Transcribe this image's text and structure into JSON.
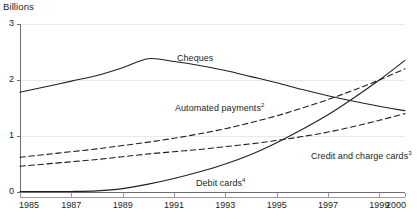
{
  "chart_data": {
    "type": "line",
    "title": "",
    "xlabel": "",
    "ylabel": "Billions",
    "ylim": [
      0,
      3
    ],
    "xlim": [
      1985,
      2000
    ],
    "grid": true,
    "legend_position": "inline-labels",
    "y_ticks": [
      "0",
      "1",
      "2",
      "3"
    ],
    "y_tick_values": [
      0,
      1,
      2,
      3
    ],
    "x_ticks": [
      "1985",
      "1987",
      "1989",
      "1991",
      "1993",
      "1995",
      "1997",
      "1999",
      "2000"
    ],
    "x_tick_values": [
      1985,
      1987,
      1989,
      1991,
      1993,
      1995,
      1997,
      1999,
      2000
    ],
    "x": [
      1985,
      1986,
      1987,
      1988,
      1989,
      1990,
      1991,
      1992,
      1993,
      1994,
      1995,
      1996,
      1997,
      1998,
      1999,
      2000
    ],
    "series": [
      {
        "name": "Cheques",
        "label": "Cheques",
        "footnote": "",
        "style": "solid",
        "color": "#231f20",
        "values": [
          1.78,
          1.88,
          1.98,
          2.08,
          2.22,
          2.38,
          2.33,
          2.26,
          2.17,
          2.06,
          1.95,
          1.83,
          1.72,
          1.62,
          1.53,
          1.45
        ]
      },
      {
        "name": "Automated payments",
        "label": "Automated payments",
        "footnote": "2",
        "style": "dashed",
        "color": "#231f20",
        "values": [
          0.62,
          0.67,
          0.72,
          0.77,
          0.83,
          0.89,
          0.96,
          1.04,
          1.13,
          1.24,
          1.36,
          1.5,
          1.65,
          1.82,
          2.0,
          2.2
        ]
      },
      {
        "name": "Credit and charge cards",
        "label": "Credit and charge cards",
        "footnote": "3",
        "style": "dashed",
        "color": "#231f20",
        "values": [
          0.46,
          0.5,
          0.54,
          0.58,
          0.63,
          0.68,
          0.72,
          0.76,
          0.81,
          0.86,
          0.92,
          0.99,
          1.07,
          1.17,
          1.28,
          1.4
        ]
      },
      {
        "name": "Debit cards",
        "label": "Debit cards",
        "footnote": "4",
        "style": "solid",
        "color": "#231f20",
        "values": [
          0.01,
          0.01,
          0.01,
          0.02,
          0.06,
          0.14,
          0.24,
          0.36,
          0.5,
          0.67,
          0.88,
          1.12,
          1.38,
          1.68,
          2.0,
          2.35
        ]
      }
    ],
    "annotations": [
      {
        "text": "Cheques",
        "footnote": "",
        "x_px": 177,
        "y_px": 53
      },
      {
        "text": "Automated payments",
        "footnote": "2",
        "x_px": 175,
        "y_px": 103
      },
      {
        "text": "Credit and charge cards",
        "footnote": "3",
        "x_px": 311,
        "y_px": 151
      },
      {
        "text": "Debit cards",
        "footnote": "4",
        "x_px": 196,
        "y_px": 178
      }
    ]
  },
  "axis": {
    "y_title": "Billions"
  }
}
